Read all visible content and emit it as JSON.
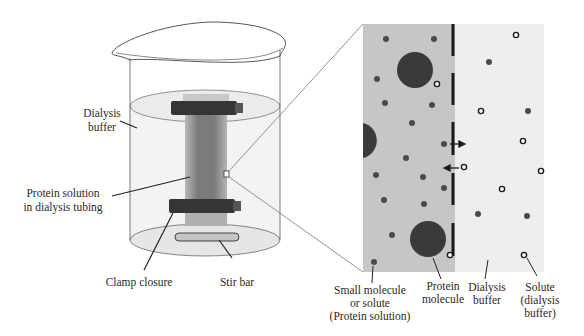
{
  "diagram": {
    "beaker": {
      "labels": {
        "dialysis_buffer_line1": "Dialysis",
        "dialysis_buffer_line2": "buffer",
        "protein_solution_line1": "Protein solution",
        "protein_solution_line2": "in dialysis tubing",
        "clamp_closure": "Clamp closure",
        "stir_bar": "Stir bar"
      }
    },
    "magnified_view": {
      "labels": {
        "small_molecule_line1": "Small molecule",
        "small_molecule_line2": "or solute",
        "small_molecule_line3": "(Protein solution)",
        "protein_molecule_line1": "Protein",
        "protein_molecule_line2": "molecule",
        "dialysis_buffer_line1": "Dialysis",
        "dialysis_buffer_line2": "buffer",
        "solute_line1": "Solute",
        "solute_line2": "(dialysis",
        "solute_line3": "buffer)"
      }
    },
    "colors": {
      "protein_side": "#c4c4c4",
      "buffer_side": "#ededed",
      "buffer_liquid": "#f0f0f0",
      "tubing": "#8a8a8a",
      "clamp": "#333333",
      "protein_molecule": "#3c3c3c",
      "small_molecule": "#4a4a4a",
      "membrane": "#1a1a1a",
      "stir_bar": "#c8c8c8"
    }
  }
}
